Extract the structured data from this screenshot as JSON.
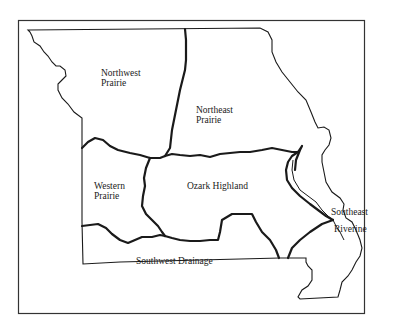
{
  "map": {
    "subject": "Missouri natural regions",
    "colors": {
      "line": "#1a1a1a",
      "background": "#ffffff"
    },
    "regions": [
      {
        "id": "northwest-prairie",
        "line1": "Northwest",
        "line2": "Prairie"
      },
      {
        "id": "northeast-prairie",
        "line1": "Northeast",
        "line2": "Prairie"
      },
      {
        "id": "western-prairie",
        "line1": "Western",
        "line2": "Prairie"
      },
      {
        "id": "ozark-highland",
        "line1": "Ozark Highland",
        "line2": ""
      },
      {
        "id": "southeast-riverine",
        "line1": "Southeast",
        "line2": "Riverine"
      },
      {
        "id": "southwest-drainage",
        "line1": "Southwest Drainage",
        "line2": ""
      }
    ]
  }
}
